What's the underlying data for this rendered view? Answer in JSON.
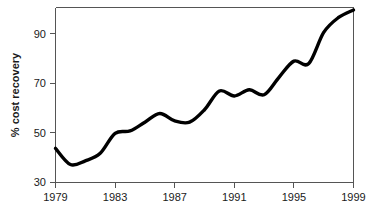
{
  "chart_data": {
    "type": "line",
    "title": "",
    "subtitle": "",
    "xlabel": "",
    "ylabel": "% cost recovery",
    "xlim": [
      1979,
      1999
    ],
    "ylim": [
      30,
      100
    ],
    "grid": false,
    "legend": null,
    "x_ticks": [
      "1979",
      "1983",
      "1987",
      "1991",
      "1995",
      "1999"
    ],
    "x_tick_values": [
      1979,
      1983,
      1987,
      1991,
      1995,
      1999
    ],
    "y_ticks": [
      "30",
      "50",
      "70",
      "90"
    ],
    "y_tick_values": [
      30,
      50,
      70,
      90
    ],
    "series": [
      {
        "name": "% cost recovery",
        "color": "#000000",
        "x": [
          1979,
          1980,
          1981,
          1982,
          1983,
          1984,
          1985,
          1986,
          1987,
          1988,
          1989,
          1990,
          1991,
          1992,
          1993,
          1994,
          1995,
          1996,
          1997,
          1998,
          1999
        ],
        "values": [
          43.5,
          37.0,
          38.5,
          41.5,
          49.5,
          50.5,
          54.0,
          57.5,
          54.5,
          54.0,
          59.0,
          66.5,
          64.5,
          67.0,
          65.0,
          72.0,
          78.5,
          77.5,
          90.0,
          96.0,
          99.0
        ]
      }
    ]
  },
  "axis": {
    "y_label": "% cost recovery"
  }
}
